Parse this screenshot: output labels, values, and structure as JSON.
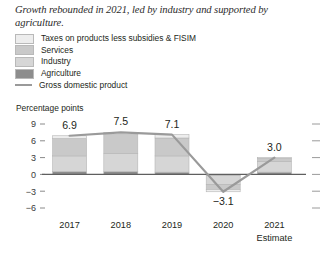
{
  "title": "Growth rebounded in 2021, led by industry and supported by agriculture.",
  "legend": {
    "items": [
      {
        "label": "Taxes on products less subsidies & FISIM",
        "color": "#ededed",
        "swatch": "box"
      },
      {
        "label": "Services",
        "color": "#c9c9c9",
        "swatch": "box"
      },
      {
        "label": "Industry",
        "color": "#d6d6d6",
        "swatch": "box"
      },
      {
        "label": "Agriculture",
        "color": "#8d8d8d",
        "swatch": "box"
      },
      {
        "label": "Gross domestic product",
        "color": "#9a9a9a",
        "swatch": "line"
      }
    ]
  },
  "axis_label": "Percentage points",
  "chart_data": {
    "type": "bar",
    "title": "Growth rebounded in 2021, led by industry and supported by agriculture.",
    "subtitle": "",
    "xlabel": "",
    "ylabel": "Percentage points",
    "ylim": [
      -6,
      9
    ],
    "yticks": [
      9,
      6,
      3,
      0,
      -3,
      -6
    ],
    "ytick_labels": [
      "9",
      "6",
      "3",
      "0",
      "−3",
      "−6"
    ],
    "grid": false,
    "legend_position": "above-plot",
    "stacked": true,
    "categories": [
      "2017",
      "2018",
      "2019",
      "2020",
      "2021"
    ],
    "category_sublabels": [
      "",
      "",
      "",
      "",
      "Estimate"
    ],
    "series": [
      {
        "name": "Agriculture",
        "color": "#8d8d8d",
        "values": [
          0.5,
          0.5,
          0.4,
          -0.2,
          0.4
        ]
      },
      {
        "name": "Industry",
        "color": "#d6d6d6",
        "values": [
          2.8,
          3.2,
          2.9,
          -1.6,
          1.9
        ]
      },
      {
        "name": "Services",
        "color": "#c9c9c9",
        "values": [
          3.1,
          3.4,
          3.2,
          -0.9,
          0.6
        ]
      },
      {
        "name": "Taxes on products less subsidies & FISIM",
        "color": "#ededed",
        "values": [
          0.5,
          0.4,
          0.6,
          -0.4,
          0.1
        ]
      }
    ],
    "line_series": {
      "name": "Gross domestic product",
      "color": "#9a9a9a",
      "values": [
        6.9,
        7.5,
        7.1,
        -3.1,
        3.0
      ]
    },
    "data_labels": [
      "6.9",
      "7.5",
      "7.1",
      "−3.1",
      "3.0"
    ]
  }
}
